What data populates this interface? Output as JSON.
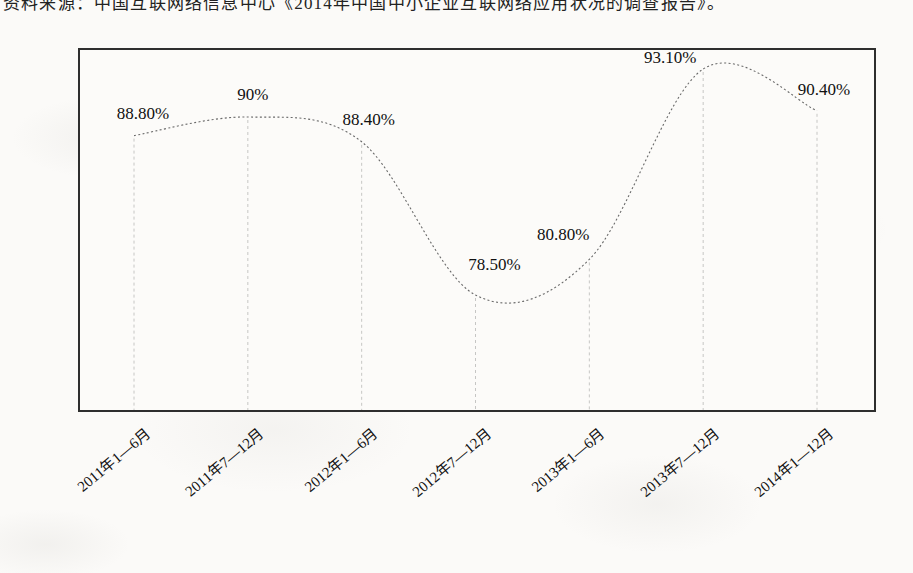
{
  "source_note": "资料来源：中国互联网络信息中心《2014年中国中小企业互联网络应用状况的调查报告》。",
  "chart_data": {
    "type": "line",
    "title": "",
    "xlabel": "",
    "ylabel": "",
    "categories": [
      "2011年1—6月",
      "2011年7—12月",
      "2012年1—6月",
      "2012年7—12月",
      "2013年1—6月",
      "2013年7—12月",
      "2014年1—12月"
    ],
    "values": [
      88.8,
      90,
      88.4,
      78.5,
      80.8,
      93.1,
      90.4
    ],
    "point_labels": [
      "88.80%",
      "90%",
      "88.40%",
      "78.50%",
      "80.80%",
      "93.10%",
      "90.40%"
    ],
    "unit": "%",
    "ylim": [
      70.9,
      94.5
    ],
    "grid": false,
    "legend": "none",
    "line_style": "smooth-dotted",
    "drop_lines": "dashed-vertical",
    "colors": {
      "curve": "#6a6a6a",
      "drop_line": "#c6c6c4",
      "frame": "#2e2e2e",
      "label_text": "#111111",
      "paper": "#fbfaf8"
    }
  }
}
